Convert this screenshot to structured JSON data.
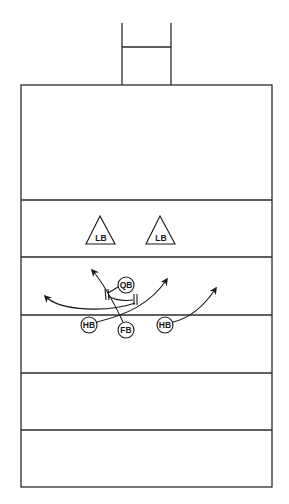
{
  "diagram": {
    "type": "football-play",
    "colors": {
      "line": "#2b2b2b",
      "background": "#ffffff"
    },
    "field": {
      "left": 21,
      "right": 272,
      "top": 85,
      "bottom": 487,
      "yard_lines_y": [
        200,
        257,
        315,
        373,
        430
      ]
    },
    "goalpost": {
      "left_x": 122,
      "right_x": 171,
      "top_y": 23,
      "crossbar_y": 47,
      "base_y": 85
    },
    "defense": [
      {
        "id": "lb1",
        "label": "LB",
        "shape": "triangle",
        "cx": 100,
        "cy": 233
      },
      {
        "id": "lb2",
        "label": "LB",
        "shape": "triangle",
        "cx": 160,
        "cy": 233
      }
    ],
    "offense": [
      {
        "id": "qb",
        "label": "QB",
        "shape": "circle",
        "cx": 126,
        "cy": 285
      },
      {
        "id": "hb1",
        "label": "HB",
        "shape": "circle",
        "cx": 89,
        "cy": 325
      },
      {
        "id": "fb",
        "label": "FB",
        "shape": "circle",
        "cx": 126,
        "cy": 330
      },
      {
        "id": "hb2",
        "label": "HB",
        "shape": "circle",
        "cx": 165,
        "cy": 325
      }
    ],
    "blocks": [
      {
        "id": "block-left",
        "x": 107,
        "y": 296
      },
      {
        "id": "block-right",
        "x": 135,
        "y": 300
      }
    ],
    "routes": [
      {
        "id": "route-sweep-left",
        "from": "qb-area",
        "direction": "left"
      },
      {
        "id": "route-fb-up",
        "from": "fb",
        "direction": "up-left"
      },
      {
        "id": "route-hb1-cross",
        "from": "hb1",
        "direction": "up-right"
      },
      {
        "id": "route-hb2-out",
        "from": "hb2",
        "direction": "up-right"
      }
    ],
    "labels": {
      "lb1": "LB",
      "lb2": "LB",
      "qb": "QB",
      "hb1": "HB",
      "fb": "FB",
      "hb2": "HB"
    }
  }
}
